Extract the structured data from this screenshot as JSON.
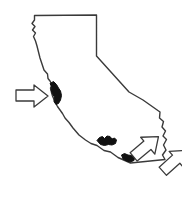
{
  "figure": {
    "title": "California state outline map",
    "subject": "California",
    "background_color": "#ffffff",
    "line_color": "#3a3a3a",
    "marker_fill_color": "#111111",
    "arrow_fill_color": "#ffffff",
    "arrow_stroke_color": "#3a3a3a",
    "line_width": 1.4,
    "width": 182,
    "height": 199
  },
  "map": {
    "name": "california-outline",
    "style": "hand-drawn line art",
    "outline_path": "M 34.5 15.5 L 96.5 15.0 L 96.5 56.0 L 129.0 92.0 L 143.0 100.0 L 160.0 112.0 L 159.5 118.0 L 163.5 121.5 L 162.0 127.0 L 165.5 131.0 L 163.0 136.0 L 166.5 139.5 L 163.5 145.0 L 166.0 150.0 L 162.5 155.0 L 165.0 159.5 L 130.5 163.0 L 118.0 157.5 L 110.5 152.0 L 104.0 150.5 L 97.0 145.5 L 91.0 143.5 L 85.5 140.0 L 79.0 135.0 L 73.0 128.0 L 69.0 122.5 L 65.0 118.0 L 62.5 113.5 L 60.0 110.0 L 57.5 106.5 L 55.5 103.0 L 54.0 99.5 L 52.5 96.0 L 51.5 92.5 L 50.5 88.0 L 52.0 84.5 L 50.0 81.0 L 48.0 78.5 L 47.5 74.0 L 44.0 70.0 L 42.0 64.0 L 40.0 58.0 L 38.5 52.0 L 37.0 46.0 L 35.5 41.0 L 33.5 36.5 L 35.5 33.0 L 32.5 30.0 L 35.0 26.5 L 32.0 23.5 L 34.5 20.0 Z",
    "regions": {
      "north_border": "straight horizontal line (Oregon border)",
      "east_border_north": "vertical line (Nevada border)",
      "east_border_diagonal": "diagonal line (Nevada border)",
      "southeast_border": "jagged line (Colorado River border)",
      "south_border": "near-straight line (Mexico border)",
      "west_coast": "wavy Pacific coastline"
    }
  },
  "bay_markers": [
    {
      "name": "san-francisco-bay-marker",
      "label": "Northern coastal bay marker",
      "cx": 57,
      "cy": 94,
      "path": "M 50.0 83.5 L 53.5 81.5 L 56.5 84.5 L 58.5 88.0 L 60.5 91.0 L 61.5 95.5 L 60.5 100.0 L 58.5 103.5 L 56.0 104.5 L 54.0 101.5 L 54.5 97.0 L 52.5 94.0 L 51.0 90.0 L 51.5 86.5 Z"
    },
    {
      "name": "santa-monica-bay-marker",
      "label": "Central-south coastal bay marker",
      "cx": 106,
      "cy": 142,
      "path": "M 97.0 140.5 L 99.5 137.5 L 102.5 136.5 L 104.5 138.5 L 107.0 136.0 L 110.0 136.5 L 112.0 139.0 L 114.5 138.0 L 116.5 140.0 L 115.5 143.5 L 112.0 145.0 L 108.5 144.5 L 104.5 145.5 L 100.5 144.5 Z"
    },
    {
      "name": "san-diego-bay-marker",
      "label": "Southern coastal bay marker",
      "cx": 128,
      "cy": 159,
      "path": "M 121.5 155.0 L 124.5 153.5 L 128.0 155.0 L 131.5 155.5 L 134.5 157.5 L 134.0 160.5 L 130.5 162.0 L 126.5 161.0 L 123.0 159.0 Z"
    }
  ],
  "arrows": [
    {
      "name": "arrow-to-san-francisco-bay",
      "label": "Arrow pointing right at the northern coastal bay",
      "direction": "right",
      "rotation_deg": 0,
      "tip_x": 49,
      "tip_y": 96,
      "origin_x": 16,
      "origin_y": 96,
      "points": "16,90 34,90 34,85 48,96 34,107 34,101 16,101"
    },
    {
      "name": "arrow-to-santa-monica-bay",
      "label": "Arrow pointing up-right at the central-south coastal bay",
      "direction": "up-right",
      "rotation_deg": -40,
      "tip_x": 100,
      "tip_y": 148,
      "origin_x": 76,
      "origin_y": 178,
      "points": "16,90 34,90 34,85 48,96 34,107 34,101 16,101"
    },
    {
      "name": "arrow-to-san-diego-bay",
      "label": "Arrow pointing up-right at the southern coastal bay",
      "direction": "up-right",
      "rotation_deg": -42,
      "tip_x": 124,
      "tip_y": 166,
      "origin_x": 103,
      "origin_y": 192,
      "points": "16,90 34,90 34,85 48,96 34,107 34,101 16,101"
    }
  ]
}
